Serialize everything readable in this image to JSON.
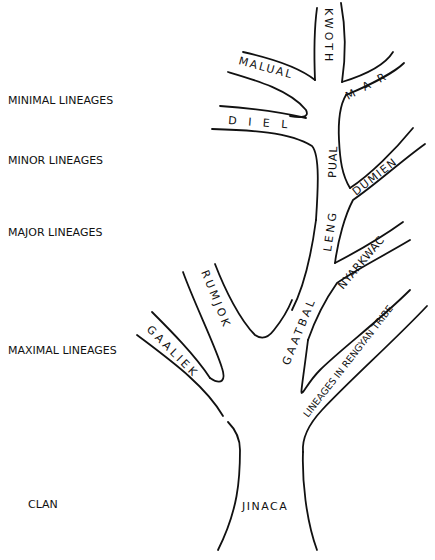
{
  "diagram": {
    "type": "segmentary-lineage-tree",
    "levels": [
      {
        "label": "MINIMAL LINEAGES"
      },
      {
        "label": "MINOR LINEAGES"
      },
      {
        "label": "MAJOR LINEAGES"
      },
      {
        "label": "MAXIMAL LINEAGES"
      },
      {
        "label": "CLAN"
      }
    ],
    "branches": {
      "kwoth": "KWOTH",
      "mar": "M A R",
      "malual": "MALUAL",
      "diel": "D I E L",
      "pual": "PUAL",
      "dumien": "DUMIEN",
      "leng": "LENG",
      "nyarkwac": "NYARKWAC",
      "gaatbal": "GAATBAL",
      "rumjok": "RUMJOK",
      "gaaliek": "GAALIEK",
      "rengyan": "LINEAGES IN RENGYAN TRIBE",
      "jinaca": "JINACA"
    },
    "stroke_color": "#111111",
    "background": "#ffffff"
  }
}
